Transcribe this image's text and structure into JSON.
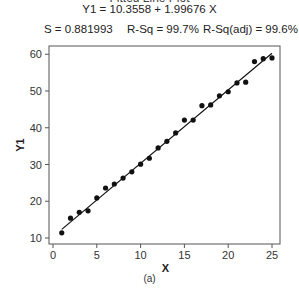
{
  "chart_data": {
    "type": "scatter",
    "title": "Fitted Line Plot",
    "equation": "Y1 = 10.3558 + 1.99676 X",
    "stats": {
      "s": "S = 0.881993",
      "rsq": "R-Sq = 99.7%",
      "rsq_adj": "R-Sq(adj) = 99.6%"
    },
    "fit": {
      "intercept": 10.3558,
      "slope": 1.99676,
      "x_range": [
        1,
        25
      ]
    },
    "xlabel": "X",
    "ylabel": "Y1",
    "xlim": [
      -0.5,
      25.8
    ],
    "ylim": [
      8.2,
      62.2
    ],
    "xticks": [
      0,
      5,
      10,
      15,
      20,
      25
    ],
    "yticks": [
      10,
      20,
      30,
      40,
      50,
      60
    ],
    "grid": false,
    "legend": "none",
    "series": [
      {
        "name": "Y1",
        "x": [
          1,
          2,
          3,
          4,
          5,
          6,
          7,
          8,
          9,
          10,
          11,
          12,
          13,
          14,
          15,
          16,
          17,
          18,
          19,
          20,
          21,
          22,
          23,
          24,
          25
        ],
        "y": [
          11.4,
          15.4,
          17.0,
          17.4,
          20.9,
          23.6,
          24.7,
          26.3,
          28.0,
          30.1,
          31.7,
          34.5,
          36.3,
          38.6,
          42.1,
          42.1,
          46.0,
          46.2,
          48.7,
          49.8,
          52.2,
          52.4,
          58.0,
          58.8,
          59.0
        ]
      }
    ],
    "caption": "(a)"
  }
}
